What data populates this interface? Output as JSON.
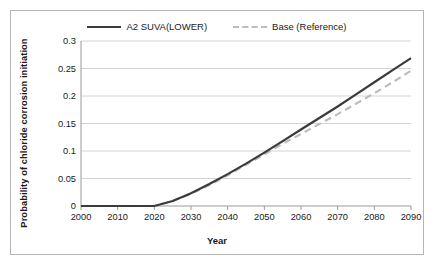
{
  "chart_data": {
    "type": "line",
    "title": "",
    "xlabel": "Year",
    "ylabel": "Probability of chloride corrosion initiation",
    "xlim": [
      2000,
      2090
    ],
    "ylim": [
      0,
      0.3
    ],
    "xticks": [
      2000,
      2010,
      2020,
      2030,
      2040,
      2050,
      2060,
      2070,
      2080,
      2090
    ],
    "yticks": [
      0,
      0.05,
      0.1,
      0.15,
      0.2,
      0.25,
      0.3
    ],
    "ytick_labels": [
      "0",
      "0.05",
      "0.1",
      "0.15",
      "0.2",
      "0.25",
      "0.3"
    ],
    "xtick_labels": [
      "2000",
      "2010",
      "2020",
      "2030",
      "2040",
      "2050",
      "2060",
      "2070",
      "2080",
      "2090"
    ],
    "grid": "horizontal",
    "legend_position": "top-center",
    "x": [
      2000,
      2005,
      2010,
      2015,
      2020,
      2025,
      2030,
      2035,
      2040,
      2045,
      2050,
      2055,
      2060,
      2065,
      2070,
      2075,
      2080,
      2085,
      2090
    ],
    "series": [
      {
        "name": "A2 SUVA(LOWER)",
        "color": "#3b3b3b",
        "style": "solid",
        "values": [
          0,
          0,
          0,
          0,
          0,
          0.009,
          0.023,
          0.04,
          0.058,
          0.077,
          0.097,
          0.118,
          0.139,
          0.16,
          0.181,
          0.203,
          0.225,
          0.247,
          0.269
        ]
      },
      {
        "name": "Base (Reference)",
        "color": "#bdbdbd",
        "style": "dashed",
        "values": [
          0,
          0,
          0,
          0,
          0,
          0.009,
          0.022,
          0.038,
          0.056,
          0.075,
          0.094,
          0.113,
          0.131,
          0.149,
          0.167,
          0.186,
          0.205,
          0.225,
          0.246
        ]
      }
    ]
  },
  "legend": {
    "entries": [
      {
        "label": "A2 SUVA(LOWER)"
      },
      {
        "label": "Base (Reference)"
      }
    ]
  }
}
